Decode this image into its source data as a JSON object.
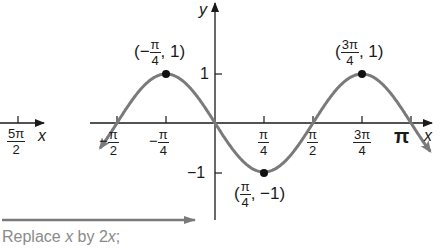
{
  "chart_data": {
    "type": "line",
    "title": "",
    "function": "y = -sin(2x)",
    "xlabel": "x",
    "ylabel": "y",
    "x_ticks": [
      {
        "value": "-π/2",
        "num": "π",
        "den": "2",
        "neg": true
      },
      {
        "value": "-π/4",
        "num": "π",
        "den": "4",
        "neg": true
      },
      {
        "value": "π/4",
        "num": "π",
        "den": "4",
        "neg": false
      },
      {
        "value": "π/2",
        "num": "π",
        "den": "2",
        "neg": false
      },
      {
        "value": "3π/4",
        "num": "3π",
        "den": "4",
        "neg": false
      },
      {
        "value": "π",
        "num": "",
        "den": "",
        "neg": false
      }
    ],
    "y_ticks": [
      "1",
      "−1"
    ],
    "points": [
      {
        "x": "-π/4",
        "y": 1,
        "label_num": "π",
        "label_den": "4",
        "label_neg": true,
        "label_y": "1"
      },
      {
        "x": "π/4",
        "y": -1,
        "label_num": "π",
        "label_den": "4",
        "label_neg": false,
        "label_y": "−1"
      },
      {
        "x": "3π/4",
        "y": 1,
        "label_num": "3π",
        "label_den": "4",
        "label_neg": false,
        "label_y": "1"
      }
    ],
    "x_range_rad": [
      -1.84,
      3.45
    ],
    "y_range": [
      -1,
      1
    ],
    "curve_color": "#7a7a7a",
    "grid": false
  },
  "labels": {
    "y_axis": "y",
    "x_axis": "x",
    "pi": "π",
    "minus": "−",
    "one": "1",
    "neg_one": "−1",
    "left_partial_tick_num": "5π",
    "left_partial_tick_den": "2",
    "left_partial_x": "x"
  },
  "caption": {
    "prefix": "Replace ",
    "var1": "x",
    "middle": " by 2",
    "var2": "x",
    "suffix": ";"
  },
  "colors": {
    "axis": "#1a1a1a",
    "curve": "#7a7a7a",
    "caption": "#8a8a8a",
    "arrow": "#7a7a7a"
  }
}
